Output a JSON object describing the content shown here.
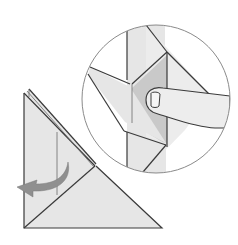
{
  "figure": {
    "title": "",
    "caption": ""
  },
  "colors": {
    "background": "#ffffff",
    "paper": "#e6e6e6",
    "paper_light": "#ececec",
    "paper_shadow": "#c9c9c9",
    "line": "#3a3a3a",
    "thin_line": "#6a6a6a",
    "circle_outline": "#8a8a8a",
    "arrow": "#8f8f8f",
    "finger": "#ededed"
  },
  "parts": {
    "main_model": "folded-paper-triangle",
    "fold_arrow": "curved-arrow-left",
    "inset": "magnified-detail-circle",
    "hand": "finger-pressing-fold"
  }
}
